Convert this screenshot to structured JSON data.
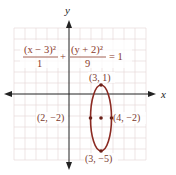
{
  "diagram": {
    "axes": {
      "x_label": "x",
      "y_label": "y"
    },
    "equation": {
      "term1_numerator": "(x − 3)²",
      "term1_denominator": "1",
      "plus": "+",
      "term2_numerator": "(y + 2)²",
      "term2_denominator": "9",
      "equals": "= 1"
    },
    "points": {
      "top": "(3, 1)",
      "bottom": "(3, −5)",
      "left": "(2, −2)",
      "right": "(4, −2)"
    },
    "colors": {
      "curve": "#8b2a22",
      "grid": "#e3d6d6",
      "axis": "#222222",
      "text": "#7a3a2e"
    }
  }
}
